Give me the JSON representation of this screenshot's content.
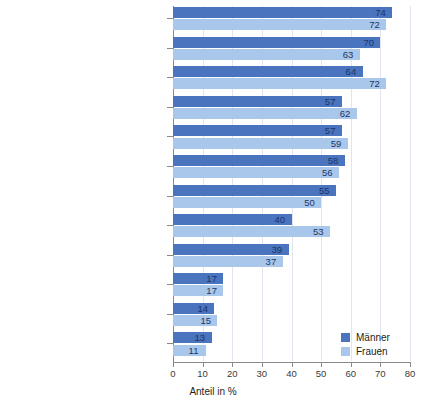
{
  "chart_data": {
    "type": "bar",
    "orientation": "horizontal",
    "title": "",
    "xlabel": "Anteil in %",
    "ylabel": "",
    "xlim": [
      0,
      80
    ],
    "xticks": [
      0,
      10,
      20,
      30,
      40,
      50,
      60,
      70,
      80
    ],
    "grid": true,
    "legend_position": "bottom-right",
    "categories": [
      "Bessere Trennung strategische\nund operative Aufgaben",
      "Mehr Kompetenzen",
      "Bezahlte Schulung\nfür Einsteiger/innen",
      "Vollamtliche/r\nGemeindepräsident/in",
      "Vollamtliche/r Geschäftsführer/in",
      "Höhere Entschädigung",
      "Gemeindefusion",
      "Ausbau der Verwaltung",
      "Verkleinerung der Milizbehörde",
      "Vergrösserung der Milizbehörde",
      "Kandidatur von\nDienstleistungsunternehmen",
      "Rücktrittsverbot während\nAmtsperiode"
    ],
    "series": [
      {
        "name": "Männer",
        "color": "#4a74be",
        "values": [
          74,
          70,
          64,
          57,
          57,
          58,
          55,
          40,
          39,
          17,
          14,
          13
        ]
      },
      {
        "name": "Frauen",
        "color": "#a9c7ea",
        "values": [
          72,
          63,
          72,
          62,
          59,
          56,
          50,
          53,
          37,
          17,
          15,
          11
        ]
      }
    ]
  },
  "legend": {
    "items": [
      {
        "label": "Männer"
      },
      {
        "label": "Frauen"
      }
    ]
  },
  "axis": {
    "x_title": "Anteil in %",
    "tick_labels": [
      "0",
      "10",
      "20",
      "30",
      "40",
      "50",
      "60",
      "70",
      "80"
    ]
  }
}
